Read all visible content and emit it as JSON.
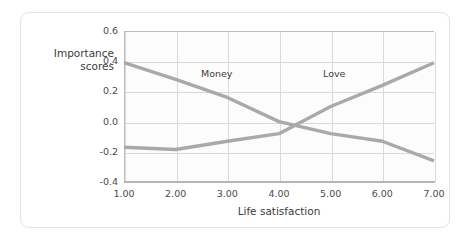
{
  "figure": {
    "border_color": "#e3e3e3",
    "background": "#ffffff"
  },
  "chart_data": {
    "type": "line",
    "title": "",
    "xlabel": "Life satisfaction",
    "ylabel": "Importance scores",
    "x": [
      1,
      2,
      3,
      4,
      5,
      6,
      7
    ],
    "xtick_labels": [
      "1.00",
      "2.00",
      "3.00",
      "4.00",
      "5.00",
      "6.00",
      "7.00"
    ],
    "ytick_labels": [
      "0.6",
      "0.4",
      "0.2",
      "0.0",
      "-0.2",
      "-0.4"
    ],
    "ytick_values": [
      0.6,
      0.4,
      0.2,
      0.0,
      -0.2,
      -0.4
    ],
    "xlim": [
      1,
      7
    ],
    "ylim": [
      -0.4,
      0.6
    ],
    "grid": true,
    "legend_position": "inline-annotation",
    "series": [
      {
        "name": "Money",
        "label": "Money",
        "color": "#a9a9a9",
        "values": [
          0.39,
          0.28,
          0.16,
          0.0,
          -0.08,
          -0.13,
          -0.26
        ],
        "annotation_text": "Money"
      },
      {
        "name": "Love",
        "label": "Love",
        "color": "#a9a9a9",
        "values": [
          -0.17,
          -0.185,
          -0.13,
          -0.08,
          0.1,
          0.24,
          0.39
        ],
        "annotation_text": "Love"
      }
    ]
  }
}
